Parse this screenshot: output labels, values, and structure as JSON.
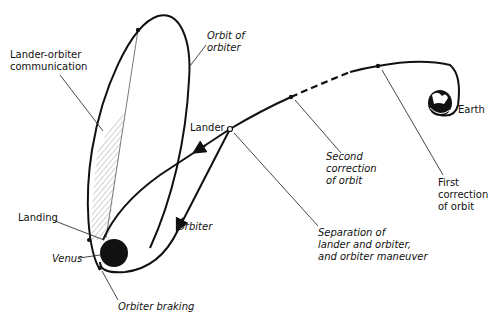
{
  "colors": {
    "ink": "#111111",
    "background": "#ffffff",
    "hatch": "#999999"
  },
  "bodies": {
    "earth": "Earth",
    "venus": "Venus"
  },
  "labels": {
    "orbit_of_orbiter": "Orbit of\norbiter",
    "lander_orbiter_communication": "Lander-orbiter\ncommunication",
    "lander": "Lander",
    "orbiter": "Orbiter",
    "landing": "Landing",
    "venus": "Venus",
    "orbiter_braking": "Orbiter braking",
    "separation": "Separation of\nlander and orbiter,\nand orbiter maneuver",
    "second_correction": "Second\ncorrection\nof orbit",
    "first_correction": "First\ncorrection\nof orbit",
    "earth": "Earth"
  }
}
